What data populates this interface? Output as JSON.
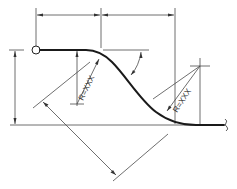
{
  "diagram": {
    "type": "engineering-dimension-drawing",
    "labels": {
      "radius_upper": "R=XXX",
      "radius_lower": "R=XXX"
    },
    "colors": {
      "line": "#4a4a4a",
      "profile": "#1a1a1a",
      "background": "#ffffff"
    },
    "elements": {
      "origin_marker": "circle-icon",
      "break_marker": "break-symbol-icon"
    }
  }
}
